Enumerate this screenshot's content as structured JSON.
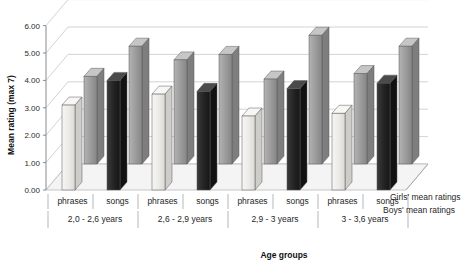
{
  "chart_data": {
    "type": "bar",
    "title": "",
    "subtitle": "",
    "xlabel": "Age groups",
    "ylabel": "Mean rating (max 7)",
    "ylim": [
      0,
      6
    ],
    "ytick_step": 1,
    "ytick_labels": [
      "0.00",
      "1.00",
      "2.00",
      "3.00",
      "4.00",
      "5.00",
      "6.00"
    ],
    "ytick_values": [
      0,
      1,
      2,
      3,
      4,
      5,
      6
    ],
    "grid": true,
    "three_d": true,
    "legend_position": "right-bottom",
    "categories": [
      "phrases",
      "songs",
      "phrases",
      "songs",
      "phrases",
      "songs",
      "phrases",
      "songs"
    ],
    "groups": [
      {
        "label": "2,0 - 2,6 years",
        "conditions": [
          "phrases",
          "songs"
        ]
      },
      {
        "label": "2,6 - 2,9  years",
        "conditions": [
          "phrases",
          "songs"
        ]
      },
      {
        "label": "2,9 - 3 years",
        "conditions": [
          "phrases",
          "songs"
        ]
      },
      {
        "label": "3 - 3,6 years",
        "conditions": [
          "phrases",
          "songs"
        ]
      }
    ],
    "series": [
      {
        "name": "Girls' mean ratings",
        "color": "#9d9d9d",
        "row": "back",
        "values": [
          3.2,
          4.3,
          3.8,
          4.0,
          3.1,
          4.7,
          3.3,
          4.3
        ]
      },
      {
        "name": "Boys' mean ratings",
        "color": "#2a2a2a",
        "row": "front",
        "values": [
          3.1,
          4.0,
          3.5,
          3.6,
          2.7,
          3.7,
          2.8,
          3.9
        ]
      }
    ],
    "legend": [
      {
        "label": "Girls' mean ratings"
      },
      {
        "label": "Boys' mean ratings"
      }
    ],
    "colors": {
      "girls_bar": "#9d9d9d",
      "boys_bar_dark": "#262626",
      "boys_bar_light": "#ededed",
      "plot_background": "#ffffff",
      "gridline": "#c8c8c8",
      "axis_line": "#8a8a8a",
      "floor": "#f4f4f4"
    }
  }
}
